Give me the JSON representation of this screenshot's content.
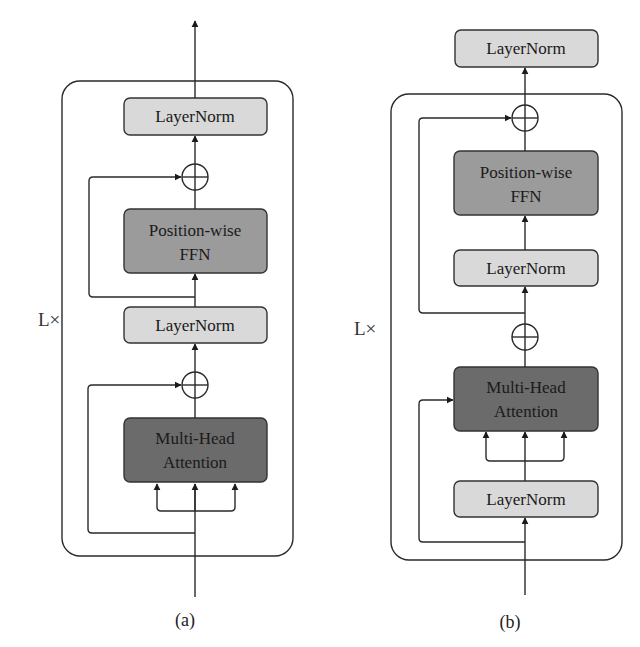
{
  "colors": {
    "layernorm_fill": "#d9d9d9",
    "ffn_fill": "#9b9b9b",
    "mha_fill": "#6b6b6b",
    "stroke": "#2a2a2a"
  },
  "panels": [
    {
      "caption": "(a)",
      "repeat_label": "L×",
      "blocks": [
        {
          "id": "ln_top",
          "lines": [
            "LayerNorm"
          ]
        },
        {
          "id": "ffn",
          "lines": [
            "Position-wise",
            "FFN"
          ]
        },
        {
          "id": "ln_mid",
          "lines": [
            "LayerNorm"
          ]
        },
        {
          "id": "mha",
          "lines": [
            "Multi-Head",
            "Attention"
          ]
        }
      ],
      "adders": 2
    },
    {
      "caption": "(b)",
      "repeat_label": "L×",
      "blocks": [
        {
          "id": "ln_final",
          "lines": [
            "LayerNorm"
          ]
        },
        {
          "id": "ffn",
          "lines": [
            "Position-wise",
            "FFN"
          ]
        },
        {
          "id": "ln_ffn",
          "lines": [
            "LayerNorm"
          ]
        },
        {
          "id": "mha",
          "lines": [
            "Multi-Head",
            "Attention"
          ]
        },
        {
          "id": "ln_attn",
          "lines": [
            "LayerNorm"
          ]
        }
      ],
      "adders": 2
    }
  ]
}
